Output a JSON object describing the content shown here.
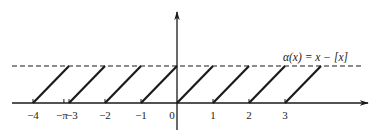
{
  "chart_data": {
    "type": "line",
    "title": "",
    "function_label": "α(x) = x − [x]",
    "xlabel": "",
    "ylabel": "",
    "x_tick_labels": [
      "−4",
      "−π",
      "−3",
      "−2",
      "−1",
      "0",
      "1",
      "2",
      "3"
    ],
    "x_tick_values": [
      -4,
      -3.14159,
      -3,
      -2,
      -1,
      0,
      1,
      2,
      3
    ],
    "xlim": [
      -4.6,
      5.5
    ],
    "ylim": [
      -0.8,
      2.5
    ],
    "dashed_line_y": 1,
    "segments": [
      {
        "x": [
          -4,
          -3
        ],
        "y": [
          0,
          1
        ]
      },
      {
        "x": [
          -3,
          -2
        ],
        "y": [
          0,
          1
        ]
      },
      {
        "x": [
          -2,
          -1
        ],
        "y": [
          0,
          1
        ]
      },
      {
        "x": [
          -1,
          0
        ],
        "y": [
          0,
          1
        ]
      },
      {
        "x": [
          0,
          1
        ],
        "y": [
          0,
          1
        ]
      },
      {
        "x": [
          1,
          2
        ],
        "y": [
          0,
          1
        ]
      },
      {
        "x": [
          2,
          3
        ],
        "y": [
          0,
          1
        ]
      },
      {
        "x": [
          3,
          4
        ],
        "y": [
          0,
          1
        ]
      }
    ],
    "grid": false,
    "legend": "none"
  },
  "colors": {
    "ink": "#1a1a1a",
    "background": "#ffffff"
  },
  "layout": {
    "origin_px": [
      177,
      103
    ],
    "unit_px_x": 36,
    "unit_px_y": 37
  }
}
